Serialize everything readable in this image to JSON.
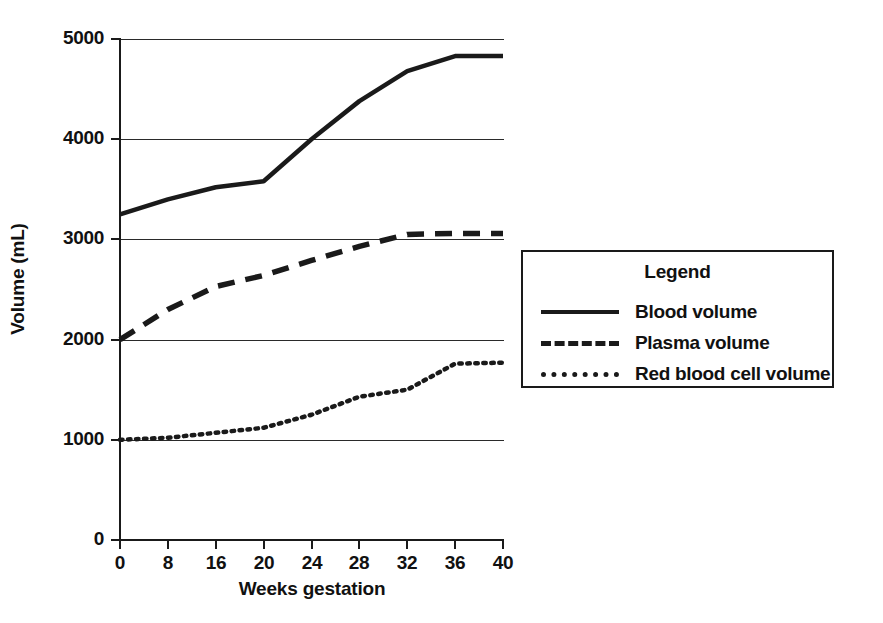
{
  "figure": {
    "background_color": "#ffffff",
    "ink_color": "#1a1a1a"
  },
  "chart_data": {
    "type": "line",
    "title": "",
    "xlabel": "Weeks gestation",
    "ylabel": "Volume (mL)",
    "xlim": [
      0,
      40
    ],
    "ylim": [
      0,
      5000
    ],
    "xticks": [
      0,
      8,
      16,
      20,
      24,
      28,
      32,
      36,
      40
    ],
    "xtick_labels": [
      "0",
      "8",
      "16",
      "20",
      "24",
      "28",
      "32",
      "36",
      "40"
    ],
    "yticks": [
      0,
      1000,
      2000,
      3000,
      4000,
      5000
    ],
    "ytick_labels": [
      "0",
      "1000",
      "2000",
      "3000",
      "4000",
      "5000"
    ],
    "grid": "horizontal",
    "gridlines_at": [
      1000,
      2000,
      3000,
      4000,
      5000
    ],
    "legend_position": "right-outside",
    "legend_title": "Legend",
    "x": [
      0,
      8,
      16,
      20,
      24,
      28,
      32,
      36,
      40
    ],
    "series": [
      {
        "name": "Blood volume",
        "style": "solid",
        "color": "#1a1a1a",
        "values": [
          3250,
          3400,
          3520,
          3580,
          4000,
          4380,
          4680,
          4830,
          4830
        ]
      },
      {
        "name": "Plasma volume",
        "style": "dashed",
        "color": "#1a1a1a",
        "values": [
          2000,
          2300,
          2530,
          2640,
          2790,
          2930,
          3050,
          3060,
          3060
        ]
      },
      {
        "name": "Red blood cell volume",
        "style": "dotted",
        "color": "#1a1a1a",
        "values": [
          1000,
          1020,
          1070,
          1120,
          1250,
          1430,
          1500,
          1760,
          1770
        ]
      }
    ]
  },
  "axes": {
    "x_title": "Weeks gestation",
    "y_title": "Volume (mL)"
  },
  "legend": {
    "title": "Legend",
    "entries": [
      {
        "label": "Blood volume",
        "style": "solid"
      },
      {
        "label": "Plasma volume",
        "style": "dashed"
      },
      {
        "label": "Red blood cell volume",
        "style": "dotted"
      }
    ]
  }
}
